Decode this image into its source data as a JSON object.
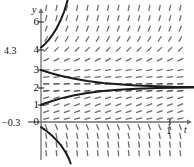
{
  "figure": {
    "title": "",
    "axis_labels": {
      "x": "t",
      "y": "y"
    },
    "x_ticks": [
      {
        "value": 1,
        "label": "1",
        "px": 170
      }
    ],
    "y_ticks": [
      {
        "value": 6,
        "label": "6",
        "px": 22
      },
      {
        "value": 4,
        "label": "4",
        "px": 50
      },
      {
        "value": 3,
        "label": "3",
        "px": 70
      },
      {
        "value": 2,
        "label": "2",
        "px": 88
      },
      {
        "value": 1,
        "label": "1",
        "px": 105
      },
      {
        "value": 0,
        "label": "0",
        "px": 122
      }
    ],
    "extra_labels": [
      {
        "text": "4.3",
        "x": 4,
        "y": 45
      },
      {
        "text": "−0.3",
        "x": 2,
        "y": 117
      }
    ]
  },
  "chart_data": {
    "type": "line",
    "title": "",
    "xlabel": "t",
    "ylabel": "y",
    "xlim": [
      -0.05,
      1.2
    ],
    "ylim": [
      -2.2,
      7.2
    ],
    "grid": false,
    "legend_position": "none",
    "equilibrium": 2,
    "slope_field": {
      "style": "dashed-tick-segments",
      "x_samples": [
        0.04,
        0.12,
        0.2,
        0.28,
        0.36,
        0.44,
        0.52,
        0.6,
        0.68,
        0.76,
        0.84,
        0.92,
        1.0,
        1.08
      ],
      "y_samples": [
        6.6,
        6.0,
        5.4,
        4.8,
        4.2,
        3.6,
        3.0,
        2.6,
        2.2,
        1.8,
        1.4,
        1.0,
        0.6,
        0.2,
        -0.3,
        -0.8,
        -1.3,
        -1.8
      ],
      "slope_rule": "dy/dt proportional to (y-2); steep up far above y=2, flat at y=2, mild up between 0 and 2, steep down below 0"
    },
    "series": [
      {
        "name": "solution-through-4.3",
        "color": "#1a1a1a",
        "start": {
          "t": 0,
          "y": 4.3
        },
        "points": [
          [
            0.0,
            4.3
          ],
          [
            0.03,
            4.5
          ],
          [
            0.06,
            4.75
          ],
          [
            0.09,
            5.05
          ],
          [
            0.12,
            5.4
          ],
          [
            0.15,
            5.85
          ],
          [
            0.18,
            6.4
          ],
          [
            0.205,
            7.0
          ],
          [
            0.22,
            7.5
          ]
        ]
      },
      {
        "name": "solution-through-3",
        "color": "#1a1a1a",
        "start": {
          "t": 0,
          "y": 3
        },
        "points": [
          [
            0.0,
            3.0
          ],
          [
            0.08,
            2.82
          ],
          [
            0.16,
            2.66
          ],
          [
            0.26,
            2.5
          ],
          [
            0.36,
            2.37
          ],
          [
            0.48,
            2.26
          ],
          [
            0.6,
            2.18
          ],
          [
            0.74,
            2.11
          ],
          [
            0.9,
            2.06
          ],
          [
            1.05,
            2.03
          ],
          [
            1.2,
            2.02
          ]
        ]
      },
      {
        "name": "solution-through-1",
        "color": "#1a1a1a",
        "start": {
          "t": 0,
          "y": 1
        },
        "points": [
          [
            0.0,
            1.0
          ],
          [
            0.08,
            1.2
          ],
          [
            0.16,
            1.38
          ],
          [
            0.26,
            1.55
          ],
          [
            0.36,
            1.68
          ],
          [
            0.48,
            1.79
          ],
          [
            0.6,
            1.86
          ],
          [
            0.74,
            1.92
          ],
          [
            0.9,
            1.96
          ],
          [
            1.05,
            1.98
          ],
          [
            1.2,
            1.99
          ]
        ]
      },
      {
        "name": "solution-through-minus-0.3",
        "color": "#1a1a1a",
        "start": {
          "t": 0,
          "y": -0.3
        },
        "points": [
          [
            0.0,
            -0.3
          ],
          [
            0.04,
            -0.5
          ],
          [
            0.08,
            -0.75
          ],
          [
            0.12,
            -1.05
          ],
          [
            0.16,
            -1.4
          ],
          [
            0.19,
            -1.75
          ],
          [
            0.215,
            -2.1
          ],
          [
            0.23,
            -2.4
          ]
        ]
      }
    ]
  },
  "colors": {
    "axis": "#6f6f6f",
    "curve": "#1a1a1a",
    "field": "#4a4a4a",
    "background": "#ffffff"
  }
}
